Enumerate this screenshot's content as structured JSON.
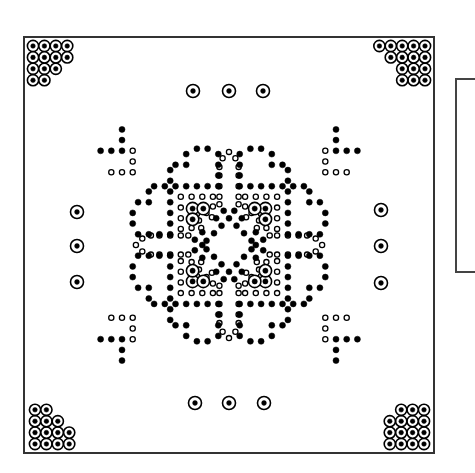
{
  "diagram": {
    "type": "pcb-drill-pattern",
    "colors": {
      "ink": "#000000",
      "border": "#333333",
      "background": "#ffffff"
    },
    "board": {
      "x": 24,
      "y": 37,
      "width": 410,
      "height": 416
    },
    "side_panel": {
      "x": 455,
      "y": 78,
      "width": 20,
      "height": 195
    },
    "center": {
      "x": 229,
      "y": 245
    },
    "pitch": 10.7,
    "corner_clusters": {
      "ring_radius": 5.6,
      "dot_radius": 2.3,
      "pitch": 11.4,
      "top_left": {
        "origin": [
          33,
          46
        ],
        "rows": [
          [
            0,
            1,
            2,
            3
          ],
          [
            0,
            1,
            2,
            3
          ],
          [
            0,
            1,
            2
          ],
          [
            0,
            1
          ]
        ]
      },
      "top_right": {
        "origin": [
          425,
          46
        ],
        "rows": [
          [
            0,
            1,
            2,
            3,
            4
          ],
          [
            0,
            1,
            2,
            3
          ],
          [
            0,
            1,
            2
          ],
          [
            0,
            1,
            2
          ]
        ],
        "mirror_x": true
      },
      "bottom_left": {
        "origin": [
          35,
          444
        ],
        "rows": [
          [
            0,
            1,
            2,
            3
          ],
          [
            0,
            1,
            2,
            3
          ],
          [
            0,
            1,
            2
          ],
          [
            0,
            1
          ]
        ],
        "mirror_y": true
      },
      "bottom_right": {
        "origin": [
          424,
          444
        ],
        "rows": [
          [
            0,
            1,
            2,
            3
          ],
          [
            0,
            1,
            2,
            3
          ],
          [
            0,
            1,
            2,
            3
          ],
          [
            0,
            1,
            2
          ]
        ],
        "mirror_x": true,
        "mirror_y": true
      }
    },
    "mount_pads": [
      [
        193,
        91
      ],
      [
        229,
        91
      ],
      [
        263,
        91
      ],
      [
        77,
        212
      ],
      [
        77,
        246
      ],
      [
        77,
        282
      ],
      [
        381,
        210
      ],
      [
        381,
        246
      ],
      [
        381,
        283
      ],
      [
        195,
        403
      ],
      [
        229,
        403
      ],
      [
        264,
        403
      ]
    ],
    "quadrant_filled": [
      [
        -3,
        -9
      ],
      [
        -2,
        -9
      ],
      [
        -4,
        -8.5
      ],
      [
        -1,
        -8.5
      ],
      [
        -5,
        -7.5
      ],
      [
        -4,
        -7.5
      ],
      [
        -1,
        -7.5
      ],
      [
        -5.5,
        -7
      ],
      [
        -1,
        -6.5
      ],
      [
        -5.5,
        -6
      ],
      [
        -5,
        -5.5
      ],
      [
        -4,
        -5.5
      ],
      [
        -3,
        -5.5
      ],
      [
        -2,
        -5.5
      ],
      [
        -1,
        -5.5
      ],
      [
        -9,
        -3
      ],
      [
        -9,
        -2
      ],
      [
        -8.5,
        -4
      ],
      [
        -8.5,
        -1
      ],
      [
        -7.5,
        -5
      ],
      [
        -7.5,
        -4
      ],
      [
        -7.5,
        -1
      ],
      [
        -7,
        -5.5
      ],
      [
        -6.5,
        -1
      ],
      [
        -6,
        -5.5
      ],
      [
        -5.5,
        -5
      ],
      [
        -5.5,
        -4
      ],
      [
        -5.5,
        -3
      ],
      [
        -5.5,
        -2
      ],
      [
        -5.5,
        -1
      ],
      [
        0,
        -2.5
      ],
      [
        -0.7,
        -1.8
      ],
      [
        -1.4,
        -1.1
      ],
      [
        -2.1,
        -0.4
      ],
      [
        -2.5,
        0
      ],
      [
        -0.5,
        -3.2
      ],
      [
        -1.2,
        -2.5
      ],
      [
        -3.2,
        -0.5
      ],
      [
        -2.5,
        -1.2
      ]
    ],
    "quadrant_hollow": [
      [
        0,
        -8.7
      ],
      [
        -0.6,
        -8.1
      ],
      [
        -0.9,
        -7.3
      ],
      [
        -0.9,
        -6.5
      ],
      [
        -0.9,
        -5.5
      ],
      [
        -8.7,
        0
      ],
      [
        -8.1,
        -0.6
      ],
      [
        -7.3,
        -0.9
      ],
      [
        -6.5,
        -0.9
      ],
      [
        -5.5,
        -0.9
      ],
      [
        -4.5,
        -4.5
      ],
      [
        -3.5,
        -4.5
      ],
      [
        -2.5,
        -4.5
      ],
      [
        -1.5,
        -4.5
      ],
      [
        -0.9,
        -4.5
      ],
      [
        -4.5,
        -3.5
      ],
      [
        -4.5,
        -2.5
      ],
      [
        -4.5,
        -1.5
      ],
      [
        -4.5,
        -0.9
      ],
      [
        -1.5,
        -3.6
      ],
      [
        -2.1,
        -3.0
      ],
      [
        -2.8,
        -2.3
      ],
      [
        -3.5,
        -1.6
      ],
      [
        -3.0,
        -2.9
      ],
      [
        -2.3,
        -3.6
      ],
      [
        -3.6,
        -2.3
      ],
      [
        -0.9,
        -3.8
      ],
      [
        -3.8,
        -0.9
      ],
      [
        -1.6,
        -2.6
      ],
      [
        -2.6,
        -1.6
      ]
    ],
    "quadrant_rings": [
      [
        -3.4,
        -3.4
      ],
      [
        -2.4,
        -3.4
      ],
      [
        -3.4,
        -2.4
      ]
    ],
    "tee_filled": [
      [
        -10,
        -10.8
      ],
      [
        -10,
        -9.8
      ],
      [
        -10,
        -8.8
      ],
      [
        -11,
        -8.8
      ],
      [
        -12,
        -8.8
      ]
    ],
    "tee_hollow": [
      [
        -9,
        -8.8
      ],
      [
        -9,
        -7.8
      ],
      [
        -9,
        -6.8
      ],
      [
        -10,
        -6.8
      ],
      [
        -11,
        -6.8
      ]
    ]
  }
}
